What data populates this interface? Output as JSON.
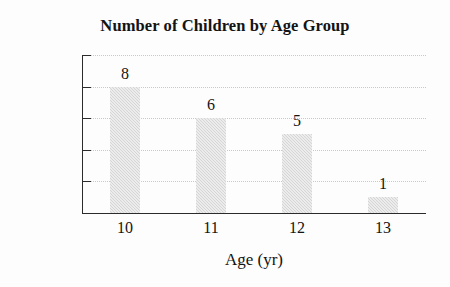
{
  "chart_data": {
    "type": "bar",
    "title": "Number of Children by Age Group",
    "xlabel": "Age (yr)",
    "ylabel": "Frequency",
    "categories": [
      "10",
      "11",
      "12",
      "13"
    ],
    "values": [
      8,
      6,
      5,
      1
    ],
    "value_labels": [
      "8",
      "6",
      "5",
      "1"
    ],
    "ylim": [
      0,
      10
    ],
    "yticks": [
      0,
      2,
      4,
      6,
      8,
      10
    ],
    "ytick_labels": [
      "0",
      "2",
      "4",
      "6",
      "8",
      "10"
    ],
    "grid": "horizontal-dotted",
    "legend": "none",
    "bar_color": "#d5d5d5",
    "axis_color": "#2b2b2b",
    "text_color": "#141414"
  }
}
